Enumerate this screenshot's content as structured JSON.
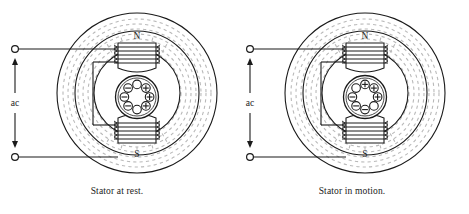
{
  "figure": {
    "type": "ac-induction-motor-cross-section",
    "panels": [
      {
        "id": "left",
        "caption": "Stator at rest.",
        "source_label": "ac",
        "pole_top_label": "N",
        "pole_bottom_label": "S",
        "rotor": {
          "conductor_count": 8,
          "symbols": [
            "empty",
            "plus",
            "plus",
            "plus",
            "empty",
            "minus",
            "minus",
            "minus"
          ],
          "note_orientation": "minus-left-plus-right"
        }
      },
      {
        "id": "right",
        "caption": "Stator in motion.",
        "source_label": "ac",
        "pole_top_label": "N",
        "pole_bottom_label": "S",
        "rotor": {
          "conductor_count": 8,
          "symbols": [
            "plus",
            "plus",
            "plus",
            "empty",
            "minus",
            "minus",
            "minus",
            "empty"
          ],
          "note_orientation": "plus-top-minus-bottom"
        }
      }
    ],
    "symbol_glyphs": {
      "plus": "+",
      "minus": "−",
      "empty": ""
    },
    "colors": {
      "ink": "#1a1a1a",
      "flux": "#b9b9b9",
      "background": "#ffffff"
    }
  }
}
